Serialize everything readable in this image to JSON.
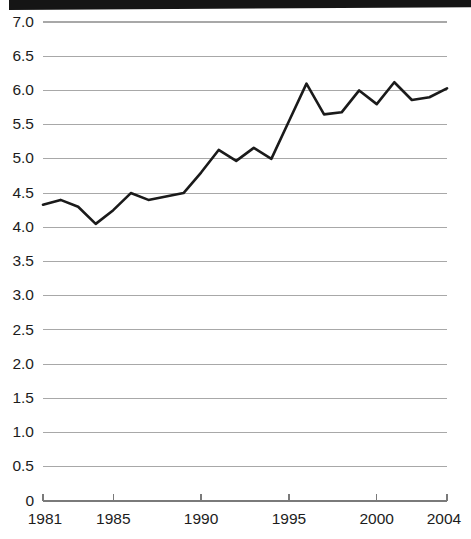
{
  "chart_data": {
    "type": "line",
    "title": "",
    "subtitle": "",
    "xlabel": "",
    "ylabel": "",
    "xlim": [
      1981,
      2004
    ],
    "ylim": [
      0,
      7.0
    ],
    "grid": true,
    "legend": null,
    "line_color": "#1a1a1a",
    "grid_color": "#a8a8a8",
    "axis_color": "#7a7a7a",
    "x": [
      1981,
      1982,
      1983,
      1984,
      1985,
      1986,
      1987,
      1988,
      1989,
      1990,
      1991,
      1992,
      1993,
      1994,
      1995,
      1996,
      1997,
      1998,
      1999,
      2000,
      2001,
      2002,
      2003,
      2004
    ],
    "values": [
      4.33,
      4.4,
      4.3,
      4.05,
      4.25,
      4.5,
      4.4,
      4.45,
      4.5,
      4.8,
      5.13,
      4.97,
      5.16,
      5.0,
      5.55,
      6.1,
      5.65,
      5.68,
      6.0,
      5.8,
      6.12,
      5.86,
      5.9,
      6.03
    ],
    "x_tick_values": [
      1981,
      1985,
      1990,
      1995,
      2000,
      2004
    ],
    "x_tick_labels": [
      "1981",
      "1985",
      "1990",
      "1995",
      "2000",
      "2004"
    ],
    "y_tick_values": [
      0,
      0.5,
      1.0,
      1.5,
      2.0,
      2.5,
      3.0,
      3.5,
      4.0,
      4.5,
      5.0,
      5.5,
      6.0,
      6.5,
      7.0
    ],
    "y_tick_labels": [
      "0",
      "0.5",
      "1.0",
      "1.5",
      "2.0",
      "2.5",
      "3.0",
      "3.5",
      "4.0",
      "4.5",
      "5.0",
      "5.5",
      "6.0",
      "6.5",
      "7.0"
    ]
  },
  "decoration": {
    "top_bar_label": "scan-edge-bar"
  }
}
